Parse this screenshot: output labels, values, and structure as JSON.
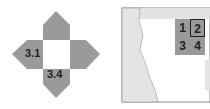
{
  "net": {
    "labels": {
      "left": "3.1",
      "bottom": "3.4"
    },
    "colors": {
      "flap": "#9a9a9a",
      "center": "#ffffff"
    }
  },
  "map": {
    "cells": [
      "1",
      "2",
      "3",
      "4"
    ],
    "highlighted_cell": "2",
    "colors": {
      "land": "#e4e4e4",
      "grid": "#9a9a9a",
      "frame": "#888888"
    }
  }
}
